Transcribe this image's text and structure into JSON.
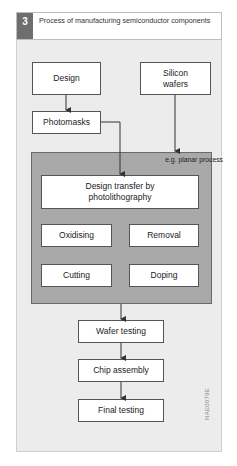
{
  "figure": {
    "number": "3",
    "title": "Process of manufacturing semiconductor components",
    "code": "NAE0079E"
  },
  "nodes": {
    "design": "Design",
    "silicon_wafers": "Silicon wafers",
    "photomasks": "Photomasks",
    "process_group_label": "e.g. planar process",
    "design_transfer": "Design transfer by photolithography",
    "oxidising": "Oxidising",
    "removal": "Removal",
    "cutting": "Cutting",
    "doping": "Doping",
    "wafer_testing": "Wafer testing",
    "chip_assembly": "Chip assembly",
    "final_testing": "Final testing"
  },
  "edges": [
    {
      "from": "Design",
      "to": "Photomasks"
    },
    {
      "from": "Photomasks",
      "to": "Design transfer by photolithography"
    },
    {
      "from": "Silicon wafers",
      "to": "e.g. planar process"
    },
    {
      "from": "e.g. planar process",
      "to": "Wafer testing"
    },
    {
      "from": "Wafer testing",
      "to": "Chip assembly"
    },
    {
      "from": "Chip assembly",
      "to": "Final testing"
    }
  ]
}
